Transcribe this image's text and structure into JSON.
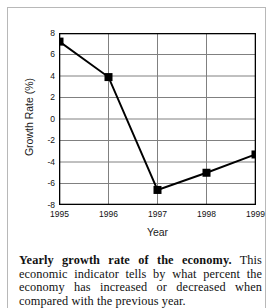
{
  "chart_data": {
    "type": "line",
    "title": "",
    "xlabel": "Year",
    "ylabel": "Growth Rate (%)",
    "categories": [
      "1995",
      "1996",
      "1997",
      "1998",
      "1999"
    ],
    "x": [
      1995,
      1996,
      1997,
      1998,
      1999
    ],
    "values": [
      7.2,
      3.9,
      -6.6,
      -5.0,
      -3.3
    ],
    "series": [
      {
        "name": "Growth Rate (%)",
        "values": [
          7.2,
          3.9,
          -6.6,
          -5.0,
          -3.3
        ]
      }
    ],
    "ylim": [
      -8,
      8
    ],
    "yticks": [
      8,
      6,
      4,
      2,
      0,
      -2,
      -4,
      -6,
      -8
    ],
    "ytick_labels": [
      "8",
      "6",
      "4",
      "2",
      "0",
      "-2",
      "-4",
      "-6",
      "-8"
    ],
    "xticks": [
      1995,
      1996,
      1997,
      1998,
      1999
    ],
    "xtick_labels": [
      "1995",
      "1996",
      "1997",
      "1998",
      "1999"
    ],
    "grid": true,
    "legend": false,
    "legend_position": "none",
    "marker": "square",
    "marker_color": "#000000",
    "line_color": "#000000",
    "grid_color": "#808080",
    "axis_color": "#000000",
    "background_color": "#ffffff"
  },
  "caption": {
    "bold_lead": "Yearly growth rate of the economy.",
    "body": " This economic indicator tells by what percent the economy has increased or decreased when compared with the previous year."
  }
}
